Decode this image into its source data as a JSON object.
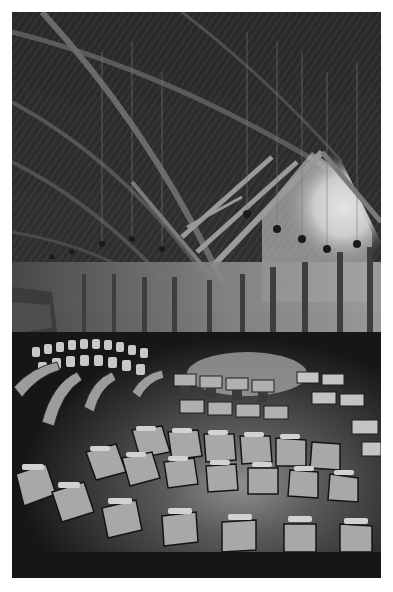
{
  "image": {
    "alt": "Black-and-white wide-angle photograph of a parliamentary debating chamber with curved rows of desks beneath a timber-trussed roof with hanging lights",
    "tone": "grayscale",
    "colors": {
      "background": "#ffffff",
      "roof_dark": "#262626",
      "truss_light": "#8a8a8a",
      "window_glow": "#e6e6e6",
      "wall_mid": "#6e6e6e",
      "desk_light": "#b4b4b4",
      "floor_dark": "#1a1a1a",
      "floor_center": "#9a9a9a"
    }
  }
}
